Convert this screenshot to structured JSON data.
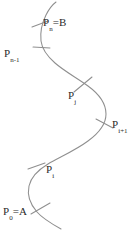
{
  "figure": {
    "type": "curve-partition-diagram",
    "stroke_color": "#8f8f8f",
    "text_color": "#2b2b2b",
    "background_color": "#ffffff",
    "width": 136,
    "height": 231
  },
  "labels": {
    "p_n": {
      "base": "P",
      "sub": "n",
      "eq": "=B",
      "full": "Pn=B"
    },
    "p_n_minus_1": {
      "base": "P",
      "sub": "n-1",
      "eq": "",
      "full": "Pn-1"
    },
    "p_j": {
      "base": "P",
      "sub": "j",
      "eq": "",
      "full": "Pj"
    },
    "p_i_plus_1": {
      "base": "P",
      "sub": "i+1",
      "eq": "",
      "full": "Pi+1"
    },
    "p_i": {
      "base": "P",
      "sub": "i",
      "eq": "",
      "full": "Pi"
    },
    "p_0": {
      "base": "P",
      "sub": "0",
      "eq": "=A",
      "full": "P0=A"
    }
  },
  "points": [
    {
      "name": "p_n",
      "x": 38,
      "y": 24
    },
    {
      "name": "p_n_minus_1",
      "x": 31,
      "y": 52
    },
    {
      "name": "p_j",
      "x": 78,
      "y": 86
    },
    {
      "name": "p_i_plus_1",
      "x": 101,
      "y": 125
    },
    {
      "name": "p_i",
      "x": 35,
      "y": 172
    },
    {
      "name": "p_0",
      "x": 35,
      "y": 208
    }
  ]
}
